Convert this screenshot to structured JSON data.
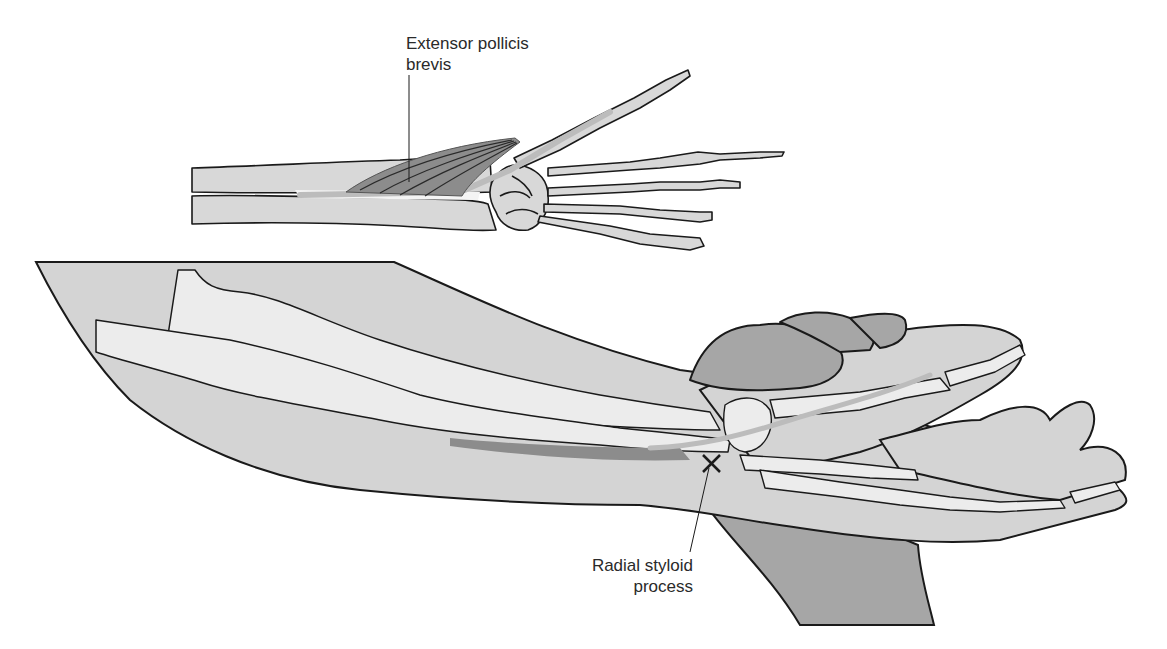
{
  "diagram": {
    "type": "anatomical-illustration",
    "panels": [
      {
        "name": "top",
        "description": "dorsal view of forearm and hand skeleton with muscle"
      },
      {
        "name": "bottom",
        "description": "lateral view of forearm and hand resting on examiner hand, bones visible"
      }
    ],
    "labels": {
      "extensor_pollicis_brevis": {
        "line1": "Extensor pollicis",
        "line2": "brevis"
      },
      "radial_styloid_process": {
        "line1": "Radial styloid",
        "line2": "process"
      }
    },
    "markers": {
      "radial_styloid": "✕"
    },
    "colors": {
      "skin": "#d4d4d4",
      "bone": "#ececec",
      "bone_top": "#d8d8d8",
      "muscle": "#8c8c8c",
      "tendon": "#bcbcbc",
      "examiner_hand": "#a6a6a6",
      "outline": "#1a1a1a"
    }
  }
}
